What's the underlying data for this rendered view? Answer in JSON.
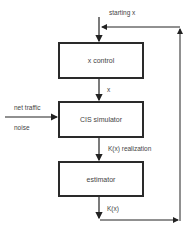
{
  "diagram": {
    "input_label": "starting  x",
    "nodes": [
      {
        "id": "x-control",
        "label": "x control"
      },
      {
        "id": "cis-simulator",
        "label": "CIS simulator"
      },
      {
        "id": "estimator",
        "label": "estimator"
      }
    ],
    "edges": [
      {
        "from": "start",
        "to": "x-control",
        "label": ""
      },
      {
        "from": "x-control",
        "to": "cis-simulator",
        "label": "x"
      },
      {
        "from": "net-traffic-noise",
        "to": "cis-simulator",
        "label": ""
      },
      {
        "from": "cis-simulator",
        "to": "estimator",
        "label": "K(x) realization"
      },
      {
        "from": "estimator",
        "to": "x-control",
        "label": "K(x)"
      }
    ],
    "side_inputs": {
      "line1": "net traffic",
      "line2": "noise"
    }
  }
}
